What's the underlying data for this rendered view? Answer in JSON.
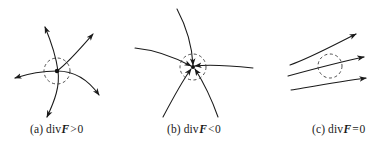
{
  "figure": {
    "background_color": "#ffffff",
    "stroke_color": "#1a1a1a",
    "width": 380,
    "height": 151
  },
  "panels": [
    {
      "id": "a",
      "label": "(a)",
      "operator": "div",
      "field_symbol": "F",
      "relation": ">",
      "value": "0",
      "caption": "(a) div F > 0",
      "meaning": "source - field lines flow outward",
      "circle": {
        "cx": 57,
        "cy": 71,
        "r": 13,
        "dashed": true
      },
      "center_dot": {
        "cx": 57,
        "cy": 71,
        "r": 2.2
      },
      "flow_direction": "outward",
      "arrow_count": 4,
      "arrow_tips": [
        {
          "x": 44,
          "y": 25
        },
        {
          "x": 95,
          "y": 32
        },
        {
          "x": 13,
          "y": 78
        },
        {
          "x": 47,
          "y": 115
        }
      ]
    },
    {
      "id": "b",
      "label": "(b)",
      "operator": "div",
      "field_symbol": "F",
      "relation": "<",
      "value": "0",
      "caption": "(b) div F < 0",
      "meaning": "sink - field lines flow inward",
      "circle": {
        "cx": 193,
        "cy": 67,
        "r": 13,
        "dashed": true
      },
      "center_dot": {
        "cx": 193,
        "cy": 67,
        "r": 2.0
      },
      "flow_direction": "inward",
      "arrow_count": 5,
      "arrow_tips": [
        {
          "x": 193,
          "y": 67
        },
        {
          "x": 193,
          "y": 67
        },
        {
          "x": 193,
          "y": 67
        },
        {
          "x": 193,
          "y": 67
        },
        {
          "x": 193,
          "y": 67
        }
      ]
    },
    {
      "id": "c",
      "label": "(c)",
      "operator": "div",
      "field_symbol": "F",
      "relation": "=",
      "value": "0",
      "caption": "(c) div F = 0",
      "meaning": "incompressible - parallel flow through region",
      "circle": {
        "cx": 330,
        "cy": 66,
        "r": 12,
        "dashed": true
      },
      "center_dot": null,
      "flow_direction": "through",
      "arrow_count": 3,
      "arrow_tips": [
        {
          "x": 358,
          "y": 33
        },
        {
          "x": 366,
          "y": 57
        },
        {
          "x": 368,
          "y": 78
        }
      ]
    }
  ]
}
